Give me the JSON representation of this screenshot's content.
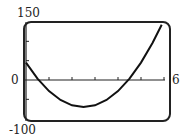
{
  "chart_data": {
    "type": "line",
    "title": "",
    "xlabel": "",
    "ylabel": "",
    "xlim": [
      0,
      6
    ],
    "ylim": [
      -100,
      150
    ],
    "x_ticks": [
      1,
      2,
      3,
      4,
      5,
      6
    ],
    "y_ticks": [
      -50,
      50,
      100
    ],
    "grid": false,
    "legend": null,
    "labels": {
      "ymax": "150",
      "ymin": "-100",
      "origin": "0",
      "xmax": "6"
    },
    "series": [
      {
        "name": "f(x)",
        "x": [
          0,
          0.5,
          1,
          1.5,
          2,
          2.5,
          3,
          3.5,
          4,
          4.5,
          5,
          5.5,
          5.9
        ],
        "values": [
          45,
          3.6,
          -28.6,
          -51.6,
          -65.4,
          -70,
          -65.4,
          -51.6,
          -28.6,
          3.6,
          45,
          95.6,
          142.7
        ]
      }
    ]
  }
}
